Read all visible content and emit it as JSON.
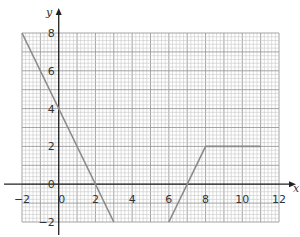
{
  "chart_data": {
    "type": "line",
    "title": "",
    "xlabel": "x",
    "ylabel": "y",
    "xlim": [
      -2,
      12
    ],
    "ylim": [
      -2,
      8
    ],
    "grid": true,
    "grid_minor_per_unit": 5,
    "x_ticks": [
      -2,
      0,
      2,
      4,
      6,
      8,
      10,
      12
    ],
    "y_ticks": [
      -2,
      0,
      2,
      4,
      6,
      8
    ],
    "series": [
      {
        "name": "segment-1",
        "points": [
          [
            -2,
            8
          ],
          [
            3,
            -2
          ]
        ]
      },
      {
        "name": "segment-2",
        "points": [
          [
            6,
            -2
          ],
          [
            8,
            2
          ]
        ]
      },
      {
        "name": "segment-3",
        "points": [
          [
            8,
            2
          ],
          [
            11,
            2
          ]
        ]
      }
    ],
    "line_color": "#8a8a8a"
  },
  "labels": {
    "x_axis": "x",
    "y_axis": "y"
  }
}
